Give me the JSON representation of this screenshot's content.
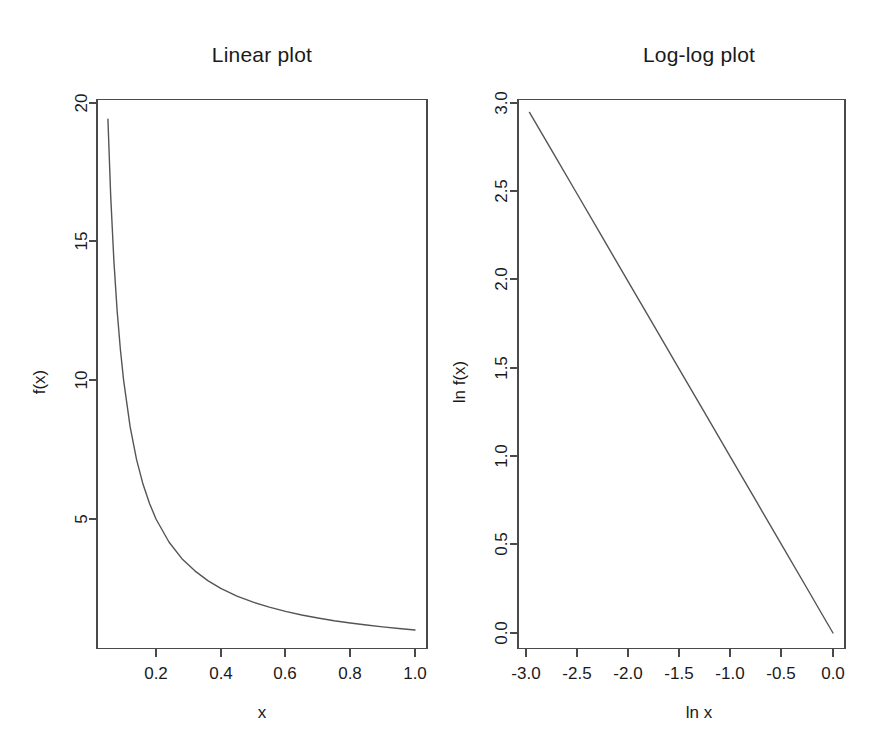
{
  "figure": {
    "background": "#ffffff",
    "line_color": "#555555",
    "axis_color": "#4a4a4a",
    "text_color": "#1a1a1a",
    "panels": 2
  },
  "chart_data": [
    {
      "type": "line",
      "panel": "left",
      "title": "Linear plot",
      "xlabel": "x",
      "ylabel": "f(x)",
      "xlim": [
        0.04,
        1.03
      ],
      "ylim": [
        0.6,
        20.3
      ],
      "grid": false,
      "legend": "none",
      "box": true,
      "xticks": [
        0.2,
        0.4,
        0.6,
        0.8,
        1.0
      ],
      "xtick_labels": [
        "0.2",
        "0.4",
        "0.6",
        "0.8",
        "1.0"
      ],
      "yticks": [
        5,
        10,
        15,
        20
      ],
      "ytick_labels": [
        "5",
        "10",
        "15",
        "20"
      ],
      "series": [
        {
          "name": "f(x) = x^-1",
          "x": [
            0.0515,
            0.06,
            0.07,
            0.08,
            0.09,
            0.1,
            0.12,
            0.14,
            0.16,
            0.18,
            0.2,
            0.24,
            0.28,
            0.32,
            0.36,
            0.4,
            0.45,
            0.5,
            0.55,
            0.6,
            0.65,
            0.7,
            0.75,
            0.8,
            0.85,
            0.9,
            0.95,
            1.0
          ],
          "y": [
            19.42,
            16.67,
            14.29,
            12.5,
            11.11,
            10.0,
            8.33,
            7.14,
            6.25,
            5.56,
            5.0,
            4.17,
            3.57,
            3.13,
            2.78,
            2.5,
            2.22,
            2.0,
            1.82,
            1.67,
            1.54,
            1.43,
            1.33,
            1.25,
            1.18,
            1.11,
            1.05,
            1.0
          ]
        }
      ]
    },
    {
      "type": "line",
      "panel": "right",
      "title": "Log-log plot",
      "xlabel": "ln x",
      "ylabel": "ln f(x)",
      "xlim": [
        -3.12,
        0.09
      ],
      "ylim": [
        -0.09,
        3.09
      ],
      "grid": false,
      "legend": "none",
      "box": true,
      "xticks": [
        -3.0,
        -2.5,
        -2.0,
        -1.5,
        -1.0,
        -0.5,
        0.0
      ],
      "xtick_labels": [
        "-3.0",
        "-2.5",
        "-2.0",
        "-1.5",
        "-1.0",
        "-0.5",
        "0.0"
      ],
      "yticks": [
        0.0,
        0.5,
        1.0,
        1.5,
        2.0,
        2.5,
        3.0
      ],
      "ytick_labels": [
        "0.0",
        "0.5",
        "1.0",
        "1.5",
        "2.0",
        "2.5",
        "3.0"
      ],
      "series": [
        {
          "name": "ln f(x) = -ln x",
          "x": [
            -2.966,
            -2.75,
            -2.5,
            -2.25,
            -2.0,
            -1.75,
            -1.5,
            -1.25,
            -1.0,
            -0.75,
            -0.5,
            -0.25,
            -0.1,
            0.0
          ],
          "y": [
            2.947,
            2.733,
            2.485,
            2.236,
            1.988,
            1.74,
            1.491,
            1.243,
            0.994,
            0.746,
            0.497,
            0.249,
            0.099,
            0.0
          ]
        }
      ]
    }
  ]
}
